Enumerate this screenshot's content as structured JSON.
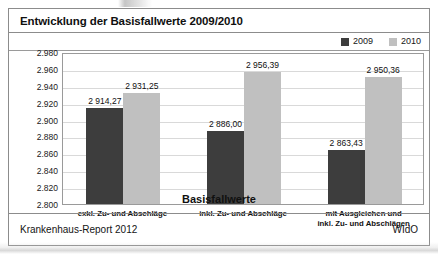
{
  "figure": {
    "title": "Entwicklung der Basisfallwerte 2009/2010",
    "source_left": "Krankenhaus-Report 2012",
    "source_right": "WIdO"
  },
  "colors": {
    "series_2009": "#3d3d3d",
    "series_2010": "#c0c0c0",
    "frame": "#8c8c8c",
    "gridline": "#d9d9d9"
  },
  "chart_data": {
    "type": "bar",
    "title": "Entwicklung der Basisfallwerte 2009/2010",
    "xlabel": "Basisfallwerte",
    "ylabel": "",
    "ylim": [
      2800,
      2980
    ],
    "ytick_step": 20,
    "ytick_labels": [
      "2.980",
      "2.960",
      "2.940",
      "2.920",
      "2.900",
      "2.880",
      "2.860",
      "2.840",
      "2.820",
      "2.800"
    ],
    "ytick_values": [
      2980,
      2960,
      2940,
      2920,
      2900,
      2880,
      2860,
      2840,
      2820,
      2800
    ],
    "grid": true,
    "legend_position": "top-right",
    "categories": [
      "exkl. Zu- und Abschläge",
      "inkl. Zu- und Abschläge",
      "mit Ausgleichen und\ninkl. Zu- und Abschlägen"
    ],
    "category_lines": [
      [
        "exkl. Zu- und Abschläge"
      ],
      [
        "inkl. Zu- und Abschläge"
      ],
      [
        "mit Ausgleichen und",
        "inkl. Zu- und Abschlägen"
      ]
    ],
    "series": [
      {
        "name": "2009",
        "color": "#3d3d3d",
        "values": [
          2914.27,
          2886.0,
          2863.43
        ],
        "labels": [
          "2 914,27",
          "2 886,00",
          "2 863,43"
        ]
      },
      {
        "name": "2010",
        "color": "#c0c0c0",
        "values": [
          2931.25,
          2956.39,
          2950.36
        ],
        "labels": [
          "2 931,25",
          "2 956,39",
          "2 950,36"
        ]
      }
    ]
  }
}
